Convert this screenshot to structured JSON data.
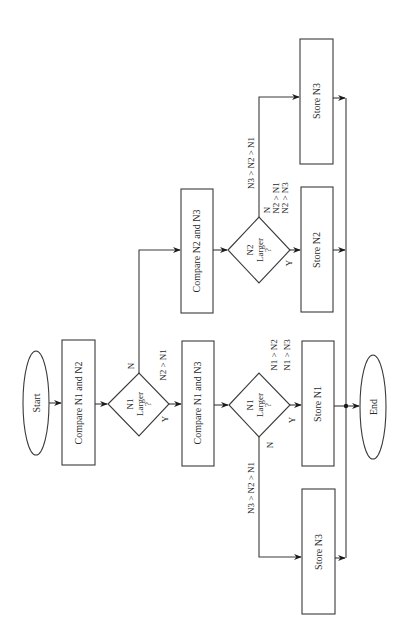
{
  "diagram": {
    "type": "flowchart",
    "orientation": "rotated-90-ccw",
    "nodes": {
      "start": "Start",
      "compare_n1_n2": "Compare N1 and N2",
      "decision1": {
        "line1": "N1",
        "line2": "Larger",
        "line3": "?"
      },
      "compare_n2_n3": "Compare N2 and N3",
      "compare_n1_n3": "Compare N1 and N3",
      "decision2": {
        "line1": "N2",
        "line2": "Larger",
        "line3": "?"
      },
      "decision3": {
        "line1": "N1",
        "line2": "Larger",
        "line3": "?"
      },
      "store_n3_top": "Store N3",
      "store_n2": "Store N2",
      "store_n1": "Store N1",
      "store_n3_bottom": "Store N3",
      "end": "End"
    },
    "edge_labels": {
      "d1_no": "N",
      "d1_yes": "Y",
      "d1_cond": "N2 > N1",
      "d2_no": "N",
      "d2_yes": "Y",
      "d2_no_cond": "N3 > N2 > N1",
      "d2_yes_cond1": "N2 > N1",
      "d2_yes_cond2": "N2 > N3",
      "d3_no": "N",
      "d3_yes": "Y",
      "d3_no_cond": "N3 > N2 > N1",
      "d3_yes_cond1": "N1 > N2",
      "d3_yes_cond2": "N1 > N3"
    },
    "colors": {
      "stroke": "#3a3a3a",
      "text": "#2a2a2a",
      "background": "#ffffff"
    }
  }
}
